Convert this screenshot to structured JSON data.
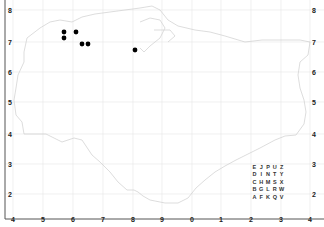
{
  "map": {
    "type": "distribution-map",
    "region_outline": "coastline of region (light grey)",
    "grid": {
      "x_labels": [
        "4",
        "5",
        "6",
        "7",
        "8",
        "9",
        "0",
        "1",
        "2",
        "3",
        "4"
      ],
      "x_positions": [
        13,
        43,
        73,
        103,
        133,
        162,
        192,
        221,
        251,
        281,
        310
      ],
      "y_labels_left": [
        "8",
        "7",
        "6",
        "5",
        "4",
        "3",
        "2"
      ],
      "y_labels_right": [
        "8",
        "7",
        "6",
        "5",
        "4",
        "3",
        "2"
      ],
      "y_positions": [
        10,
        42,
        72,
        102,
        134,
        164,
        194
      ],
      "gridline_color": "#e6e6e6",
      "frame_color": "#555555"
    },
    "points": [
      {
        "x": 64,
        "y": 32
      },
      {
        "x": 76,
        "y": 32
      },
      {
        "x": 64,
        "y": 38
      },
      {
        "x": 82,
        "y": 44
      },
      {
        "x": 88,
        "y": 44
      },
      {
        "x": 135,
        "y": 50
      }
    ],
    "point_color": "#000000",
    "letter_key": {
      "rows": [
        [
          "E",
          "J",
          "P",
          "U",
          "Z"
        ],
        [
          "D",
          "I",
          "N",
          "T",
          "Y"
        ],
        [
          "C",
          "H",
          "M",
          "S",
          "X"
        ],
        [
          "B",
          "G",
          "L",
          "R",
          "W"
        ],
        [
          "A",
          "F",
          "K",
          "Q",
          "V"
        ]
      ]
    }
  }
}
